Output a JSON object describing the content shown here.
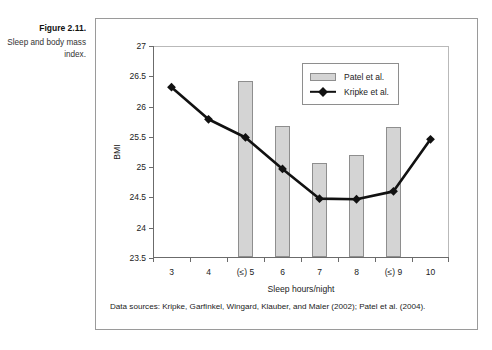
{
  "caption": {
    "title": "Figure 2.11.",
    "text": "Sleep and body mass index."
  },
  "source_note": "Data sources: Kripke, Garfinkel, Wingard, Klauber, and Maler (2002); Patel et al. (2004).",
  "legend": {
    "position": "top-right-inside",
    "entries": [
      {
        "label": "Patel et al.",
        "marker": "bar-swatch",
        "color": "#d4d4d4"
      },
      {
        "label": "Kripke et al.",
        "marker": "line-diamond",
        "color": "#111111"
      }
    ]
  },
  "chart_data": {
    "type": "bar",
    "title": "",
    "xlabel": "Sleep hours/night",
    "ylabel": "BMI",
    "categories": [
      "3",
      "4",
      "(≤) 5",
      "6",
      "7",
      "8",
      "(≤) 9",
      "10"
    ],
    "ylim": [
      23.5,
      27
    ],
    "yticks": [
      23.5,
      24,
      24.5,
      25,
      25.5,
      26,
      26.5,
      27
    ],
    "ytick_labels": [
      "23.5",
      "24",
      "24.5",
      "25",
      "25.5",
      "26",
      "26.5",
      "27"
    ],
    "grid": false,
    "series": [
      {
        "name": "Patel et al.",
        "type": "bar",
        "color": "#d4d4d4",
        "values": [
          null,
          null,
          26.4,
          25.66,
          25.06,
          25.18,
          25.64,
          null
        ]
      },
      {
        "name": "Kripke et al.",
        "type": "line",
        "color": "#111111",
        "marker": "diamond",
        "values": [
          26.32,
          25.79,
          25.49,
          24.97,
          24.48,
          24.47,
          24.6,
          25.46
        ]
      }
    ]
  }
}
